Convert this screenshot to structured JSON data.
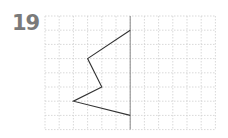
{
  "problem": {
    "number": "19",
    "grid": {
      "origin_px": [
        45,
        16
      ],
      "cell_px": 14.2,
      "cols": 12,
      "rows": 8,
      "grid_color": "#cfcfcf",
      "axis_color": "#888888",
      "line_color": "#333333"
    },
    "symmetry_axis": {
      "col": 6
    },
    "polyline_vertices": [
      {
        "col": 6,
        "row": 1
      },
      {
        "col": 3,
        "row": 3
      },
      {
        "col": 4,
        "row": 5
      },
      {
        "col": 2,
        "row": 6
      },
      {
        "col": 6,
        "row": 7
      }
    ]
  }
}
